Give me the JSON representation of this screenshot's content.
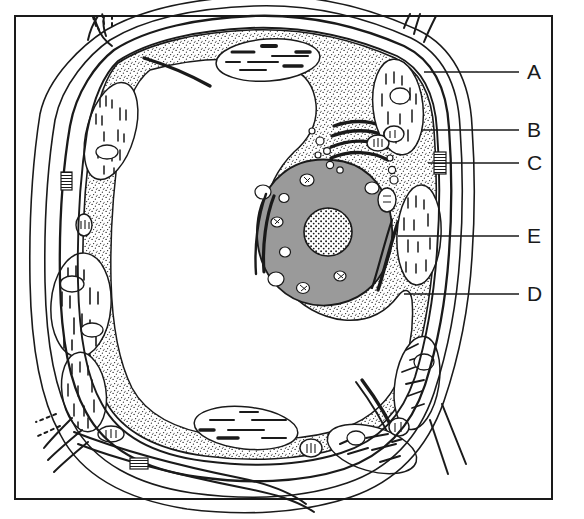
{
  "figure": {
    "background_color": "#ffffff",
    "border_color": "#1a1a1a",
    "ink_color": "#1a1a1a",
    "nucleus_fill": "#9a9a9a",
    "cytoplasm_fill": "#ffffff",
    "vacuole_fill": "#ffffff"
  },
  "labels": [
    {
      "id": "A",
      "text": "A",
      "x": 527,
      "y": 61,
      "leader_x1": 424,
      "leader_x2": 519,
      "leader_y": 72
    },
    {
      "id": "B",
      "text": "B",
      "x": 527,
      "y": 119,
      "leader_x1": 421,
      "leader_x2": 519,
      "leader_y": 130
    },
    {
      "id": "C",
      "text": "C",
      "x": 527,
      "y": 152,
      "leader_x1": 428,
      "leader_x2": 519,
      "leader_y": 163
    },
    {
      "id": "E",
      "text": "E",
      "x": 527,
      "y": 225,
      "leader_x1": 398,
      "leader_x2": 519,
      "leader_y": 236
    },
    {
      "id": "D",
      "text": "D",
      "x": 527,
      "y": 283,
      "leader_x1": 404,
      "leader_x2": 519,
      "leader_y": 294
    }
  ],
  "structures": [
    {
      "name": "cell-wall",
      "label_ref": "A"
    },
    {
      "name": "chloroplast",
      "label_ref": "B"
    },
    {
      "name": "plasmodesmata",
      "label_ref": "C"
    },
    {
      "name": "vacuole",
      "label_ref": "D"
    },
    {
      "name": "endoplasmic-reticulum",
      "label_ref": "E"
    },
    {
      "name": "nucleus",
      "label_ref": null
    },
    {
      "name": "nucleolus",
      "label_ref": null
    },
    {
      "name": "golgi-apparatus",
      "label_ref": null
    },
    {
      "name": "mitochondrion",
      "label_ref": null
    }
  ]
}
